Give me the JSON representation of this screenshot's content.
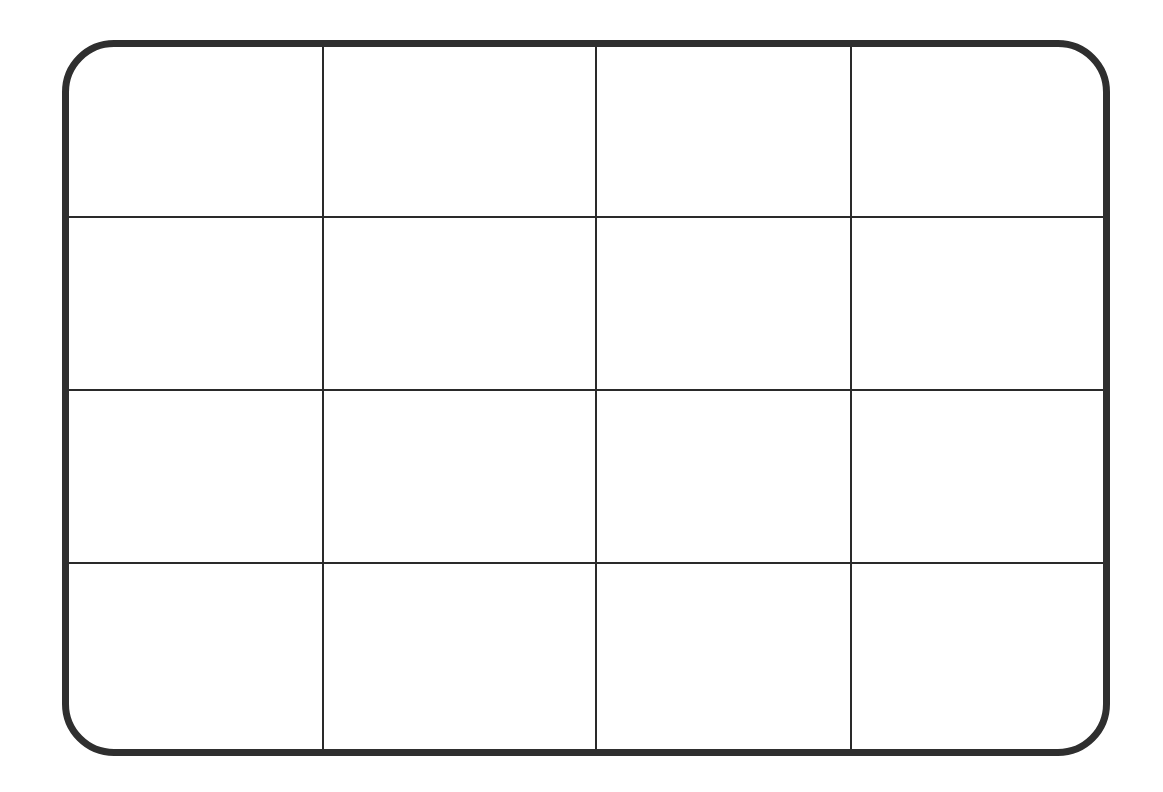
{
  "grid": {
    "rows": 4,
    "columns": 4,
    "border_color": "#2f2f2f",
    "line_color": "#2a2a2a",
    "column_divider_x": [
      322,
      595,
      850
    ],
    "row_divider_y": [
      216,
      389,
      562
    ],
    "cells": [
      [
        "",
        "",
        "",
        ""
      ],
      [
        "",
        "",
        "",
        ""
      ],
      [
        "",
        "",
        "",
        ""
      ],
      [
        "",
        "",
        "",
        ""
      ]
    ]
  }
}
